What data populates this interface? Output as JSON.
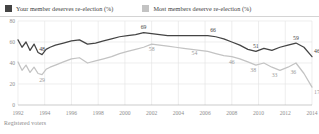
{
  "legend": {
    "items": [
      {
        "label": "Your member deserves re-election (%)",
        "color": "#444444",
        "key": "your_member"
      },
      {
        "label": "Most members deserve re-election (%)",
        "color": "#c3c3c3",
        "key": "most_members"
      }
    ]
  },
  "footnote": "Registered voters",
  "chart_data": {
    "type": "line",
    "title": "",
    "subtitle": "",
    "xlabel": "",
    "ylabel": "",
    "xlim": [
      1992,
      2014
    ],
    "ylim": [
      0,
      80
    ],
    "grid": true,
    "legend_position": "top",
    "yticks": [
      0,
      20,
      40,
      60,
      80
    ],
    "xticks": [
      1992,
      1994,
      1996,
      1998,
      2000,
      2002,
      2004,
      2006,
      2008,
      2010,
      2012,
      2014
    ],
    "series": [
      {
        "name": "Your member deserves re-election (%)",
        "color": "#444444",
        "x": [
          1992.0,
          1992.3,
          1992.6,
          1992.9,
          1993.2,
          1993.5,
          1993.8,
          1994.1,
          1994.4,
          1994.8,
          1995.4,
          1996.0,
          1996.6,
          1997.2,
          1997.8,
          1998.4,
          1999.0,
          1999.6,
          2000.2,
          2000.8,
          2001.4,
          2002.0,
          2002.6,
          2003.2,
          2003.8,
          2004.4,
          2005.0,
          2005.6,
          2006.2,
          2006.8,
          2007.4,
          2008.0,
          2008.6,
          2009.2,
          2009.8,
          2010.4,
          2011.0,
          2011.6,
          2012.2,
          2012.8,
          2013.4,
          2014.0
        ],
        "y": [
          62,
          55,
          60,
          52,
          58,
          50,
          48,
          53,
          55,
          57,
          59,
          61,
          62,
          58,
          59,
          61,
          63,
          65,
          66,
          67,
          69,
          68,
          67,
          66,
          66,
          66,
          66,
          66,
          66,
          65,
          63,
          60,
          57,
          53,
          51,
          54,
          52,
          55,
          57,
          59,
          55,
          46
        ],
        "labels": [
          {
            "x": 1993.8,
            "y": 48,
            "text": "48"
          },
          {
            "x": 2001.4,
            "y": 69,
            "text": "69"
          },
          {
            "x": 2006.6,
            "y": 66,
            "text": "66"
          },
          {
            "x": 2009.8,
            "y": 51,
            "text": "51"
          },
          {
            "x": 2012.8,
            "y": 59,
            "text": "59"
          },
          {
            "x": 2014.0,
            "y": 46,
            "text": "46"
          }
        ]
      },
      {
        "name": "Most members deserve re-election (%)",
        "color": "#c3c3c3",
        "x": [
          1992.0,
          1992.3,
          1992.6,
          1992.9,
          1993.2,
          1993.5,
          1993.8,
          1994.1,
          1994.4,
          1994.8,
          1995.4,
          1996.0,
          1996.6,
          1997.2,
          1997.8,
          1998.4,
          1999.0,
          1999.6,
          2000.2,
          2000.8,
          2001.4,
          2002.0,
          2002.6,
          2003.2,
          2003.8,
          2004.4,
          2005.0,
          2005.6,
          2006.2,
          2006.8,
          2007.4,
          2008.0,
          2008.6,
          2009.2,
          2009.8,
          2010.4,
          2011.0,
          2011.6,
          2012.2,
          2012.8,
          2013.4,
          2014.0
        ],
        "y": [
          41,
          33,
          38,
          31,
          36,
          30,
          29,
          34,
          36,
          38,
          41,
          44,
          45,
          40,
          42,
          44,
          46,
          49,
          51,
          53,
          55,
          58,
          57,
          56,
          55,
          54,
          53,
          52,
          51,
          49,
          47,
          46,
          44,
          41,
          38,
          40,
          36,
          33,
          36,
          40,
          30,
          17
        ],
        "labels": [
          {
            "x": 1993.8,
            "y": 29,
            "text": "29"
          },
          {
            "x": 2002.0,
            "y": 58,
            "text": "58"
          },
          {
            "x": 2005.2,
            "y": 54,
            "text": "54"
          },
          {
            "x": 2008.0,
            "y": 46,
            "text": "46"
          },
          {
            "x": 2009.6,
            "y": 38,
            "text": "38"
          },
          {
            "x": 2011.2,
            "y": 33,
            "text": "33"
          },
          {
            "x": 2012.6,
            "y": 36,
            "text": "36"
          },
          {
            "x": 2014.0,
            "y": 17,
            "text": "17"
          }
        ]
      }
    ]
  }
}
